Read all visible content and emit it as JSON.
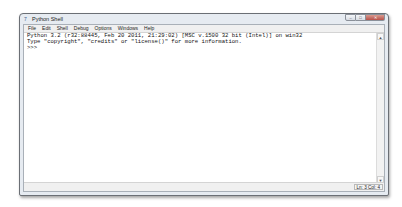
{
  "window": {
    "title": "Python Shell",
    "icon": "idle-icon",
    "controls": {
      "minimize": "–",
      "maximize": "□",
      "close": "✕"
    }
  },
  "menubar": {
    "items": [
      {
        "label": "File"
      },
      {
        "label": "Edit"
      },
      {
        "label": "Shell"
      },
      {
        "label": "Debug"
      },
      {
        "label": "Options"
      },
      {
        "label": "Windows"
      },
      {
        "label": "Help"
      }
    ]
  },
  "shell": {
    "lines": [
      "Python 3.2 (r32:88445, Feb 20 2011, 21:29:02) [MSC v.1500 32 bit (Intel)] on win32",
      "Type \"copyright\", \"credits\" or \"license()\" for more information.",
      ">>> "
    ]
  },
  "scrollbar": {
    "up_arrow": "▲",
    "down_arrow": "▼"
  },
  "statusbar": {
    "position": "Ln: 3 Col: 4"
  },
  "colors": {
    "frame": "#e6ebf1",
    "close_button": "#c0574e",
    "text": "#111111"
  }
}
